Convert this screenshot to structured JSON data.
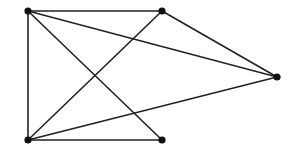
{
  "diagram": {
    "type": "graph",
    "width": 299,
    "height": 156,
    "colors": {
      "edge": "#222222",
      "node": "#111111",
      "background": "#ffffff"
    },
    "nodes": [
      {
        "id": "A",
        "x": 28,
        "y": 11
      },
      {
        "id": "B",
        "x": 162,
        "y": 11
      },
      {
        "id": "C",
        "x": 277,
        "y": 77
      },
      {
        "id": "D",
        "x": 28,
        "y": 140
      },
      {
        "id": "E",
        "x": 162,
        "y": 140
      }
    ],
    "edges": [
      {
        "from": "A",
        "to": "B"
      },
      {
        "from": "A",
        "to": "D"
      },
      {
        "from": "A",
        "to": "C"
      },
      {
        "from": "A",
        "to": "E"
      },
      {
        "from": "B",
        "to": "C"
      },
      {
        "from": "B",
        "to": "D"
      },
      {
        "from": "D",
        "to": "E"
      },
      {
        "from": "D",
        "to": "C"
      }
    ]
  }
}
